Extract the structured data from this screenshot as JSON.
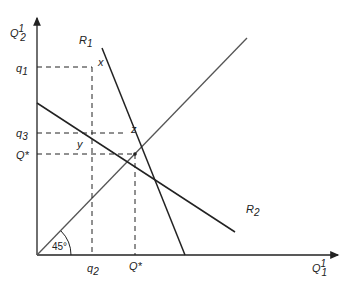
{
  "diagram": {
    "type": "reaction-function-diagram",
    "axes": {
      "y_label": "Q",
      "y_label_sup": "1",
      "y_label_sub": "2",
      "x_label": "Q",
      "x_label_sup": "1",
      "x_label_sub": "1"
    },
    "curves": {
      "r1_label": "R",
      "r1_sub": "1",
      "r2_label": "R",
      "r2_sub": "2"
    },
    "points": {
      "x": "x",
      "y": "y",
      "z": "z"
    },
    "y_ticks": {
      "q1": "q",
      "q1_sub": "1",
      "q3": "q",
      "q3_sub": "3",
      "qstar": "Q*"
    },
    "x_ticks": {
      "q2": "q",
      "q2_sub": "2",
      "qstar": "Q*"
    },
    "angle_label": "45°",
    "colors": {
      "line": "#222222",
      "diagonal": "#555555",
      "background": "#ffffff"
    }
  }
}
